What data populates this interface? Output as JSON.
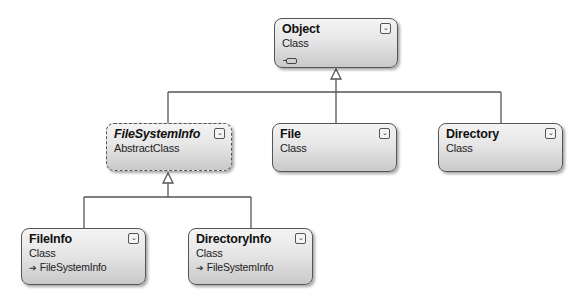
{
  "diagram": {
    "type": "class-diagram",
    "colors": {
      "line": "#555555",
      "box_border": "#555555",
      "box_fill_top": "#f4f4f4",
      "box_fill_bottom": "#c9c9c9"
    },
    "classes": [
      {
        "id": "object",
        "name": "Object",
        "kind": "Class",
        "abstract": false,
        "base": null,
        "has_field_icon": true,
        "collapse_icon": "collapse-chevron"
      },
      {
        "id": "filesysteminfo",
        "name": "FileSystemInfo",
        "kind": "AbstractClass",
        "abstract": true,
        "base": null,
        "collapse_icon": "collapse-chevron"
      },
      {
        "id": "file",
        "name": "File",
        "kind": "Class",
        "abstract": false,
        "base": null,
        "collapse_icon": "collapse-chevron"
      },
      {
        "id": "directory",
        "name": "Directory",
        "kind": "Class",
        "abstract": false,
        "base": null,
        "collapse_icon": "collapse-chevron"
      },
      {
        "id": "fileinfo",
        "name": "FileInfo",
        "kind": "Class",
        "abstract": false,
        "base": "FileSystemInfo",
        "collapse_icon": "collapse-chevron"
      },
      {
        "id": "directoryinfo",
        "name": "DirectoryInfo",
        "kind": "Class",
        "abstract": false,
        "base": "FileSystemInfo",
        "collapse_icon": "collapse-chevron"
      }
    ],
    "inheritance": [
      {
        "from": "FileSystemInfo",
        "to": "Object"
      },
      {
        "from": "File",
        "to": "Object"
      },
      {
        "from": "Directory",
        "to": "Object"
      },
      {
        "from": "FileInfo",
        "to": "FileSystemInfo"
      },
      {
        "from": "DirectoryInfo",
        "to": "FileSystemInfo"
      }
    ],
    "glyphs": {
      "collapse": "⌄",
      "base_arrow": "➔"
    }
  }
}
